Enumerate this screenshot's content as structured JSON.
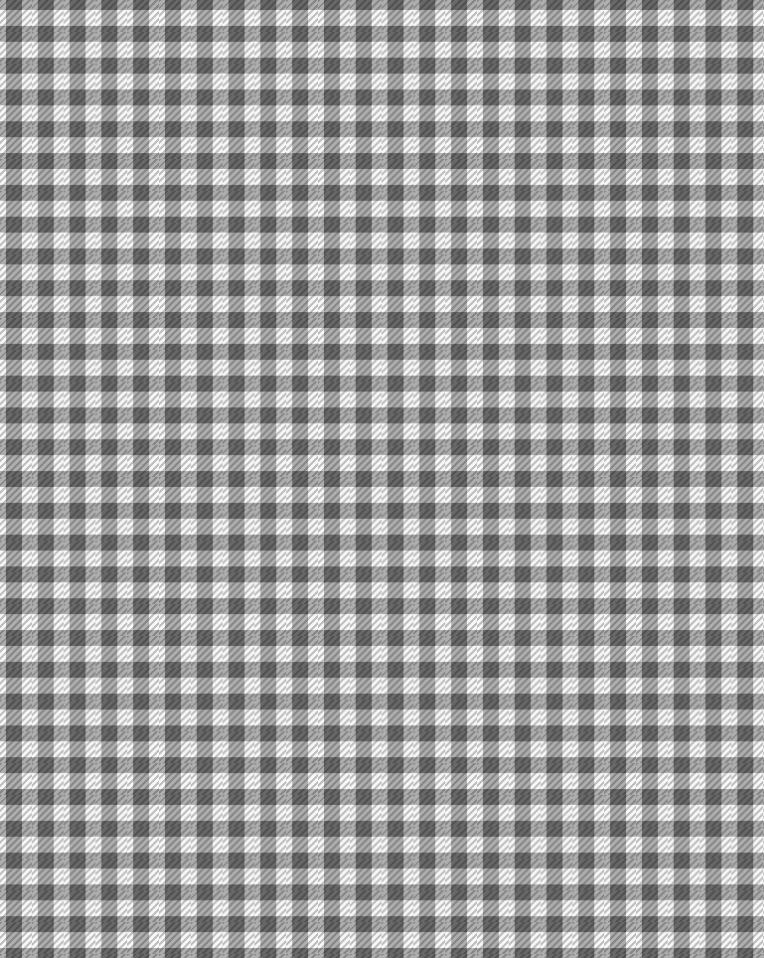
{
  "image": {
    "subject": "gray and white gingham check fabric with twill houndstooth texture",
    "colors": {
      "gray": "#9a9a9a",
      "white": "#f7f7f7"
    },
    "pattern_repeat_px": 31.8
  }
}
